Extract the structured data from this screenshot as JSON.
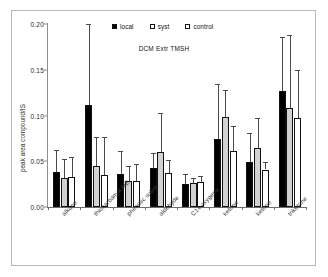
{
  "chart_data": {
    "type": "bar",
    "title": "DCM Extr TMSH",
    "xlabel": "",
    "ylabel": "peak area compound/IS",
    "ylim": [
      0.0,
      0.2
    ],
    "yticks": [
      "0.00",
      "0.05",
      "0.10",
      "0.15",
      "0.20"
    ],
    "ytick_values": [
      0.0,
      0.05,
      0.1,
      0.15,
      0.2
    ],
    "grid": false,
    "legend_position": "top-center",
    "categories": [
      "alkane",
      "thiocarbamat ME",
      "phenolic subst.",
      "aldehyde",
      "C14 oxygena",
      "ketone",
      "ketone",
      "triketone"
    ],
    "series": [
      {
        "name": "local",
        "color": "#000000",
        "values": [
          0.038,
          0.112,
          0.036,
          0.043,
          0.025,
          0.074,
          0.049,
          0.127
        ],
        "errors": [
          0.024,
          0.088,
          0.025,
          0.016,
          0.011,
          0.06,
          0.032,
          0.059
        ]
      },
      {
        "name": "syst",
        "color": "#d2d2d2",
        "values": [
          0.032,
          0.045,
          0.028,
          0.06,
          0.026,
          0.098,
          0.064,
          0.108
        ],
        "errors": [
          0.02,
          0.032,
          0.017,
          0.043,
          0.006,
          0.03,
          0.033,
          0.08
        ]
      },
      {
        "name": "control",
        "color": "#ffffff",
        "values": [
          0.033,
          0.035,
          0.028,
          0.037,
          0.027,
          0.061,
          0.041,
          0.097
        ],
        "errors": [
          0.022,
          0.042,
          0.019,
          0.014,
          0.007,
          0.027,
          0.008,
          0.053
        ]
      }
    ]
  },
  "legend": {
    "items": [
      {
        "label": "local",
        "style": "filled"
      },
      {
        "label": "syst",
        "style": "open"
      },
      {
        "label": "control",
        "style": "open"
      }
    ]
  }
}
